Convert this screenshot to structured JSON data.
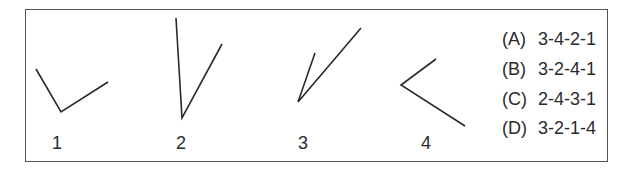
{
  "figures": [
    {
      "label": "1",
      "points": [
        [
          36,
          69
        ],
        [
          61,
          112
        ],
        [
          108,
          82
        ]
      ],
      "label_pos": [
        57,
        143
      ]
    },
    {
      "label": "2",
      "points": [
        [
          176,
          18
        ],
        [
          182,
          118
        ],
        [
          222,
          44
        ]
      ],
      "label_pos": [
        181,
        143
      ]
    },
    {
      "label": "3",
      "points": [
        [
          315,
          53
        ],
        [
          298,
          102
        ],
        [
          361,
          28
        ]
      ],
      "label_pos": [
        303,
        143
      ]
    },
    {
      "label": "4",
      "points": [
        [
          436,
          59
        ],
        [
          401,
          85
        ],
        [
          465,
          126
        ]
      ],
      "label_pos": [
        426,
        143
      ]
    }
  ],
  "options": [
    {
      "letter": "(A)",
      "value": "3-4-2-1"
    },
    {
      "letter": "(B)",
      "value": "3-2-4-1"
    },
    {
      "letter": "(C)",
      "value": "2-4-3-1"
    },
    {
      "letter": "(D)",
      "value": "3-2-1-4"
    }
  ],
  "colors": {
    "line": "#2a2a2a",
    "frame": "#555555"
  }
}
